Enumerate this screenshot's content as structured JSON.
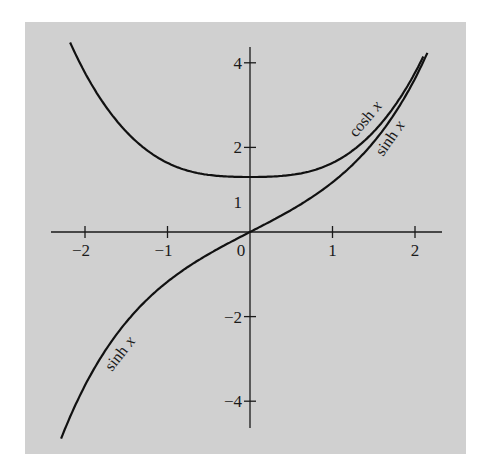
{
  "chart_data": {
    "type": "line",
    "title": "",
    "xlabel": "",
    "ylabel": "",
    "xlim": [
      -2.3,
      2.3
    ],
    "ylim": [
      -4.6,
      4.4
    ],
    "grid": false,
    "legend": "none (inline curve labels)",
    "x_ticks": [
      -2,
      -1,
      0,
      1,
      2
    ],
    "x_tick_labels": [
      "−2",
      "−1",
      "0",
      "1",
      "2"
    ],
    "y_ticks": [
      4,
      2,
      -2,
      -4
    ],
    "y_tick_labels": [
      "4",
      "2",
      "−2",
      "−4"
    ],
    "y_extra_label": {
      "value": 1,
      "text": "1"
    },
    "series": [
      {
        "name": "cosh x",
        "label": "cosh x",
        "x": [
          -2.2,
          -2.0,
          -1.5,
          -1.0,
          -0.5,
          0,
          0.5,
          1.0,
          1.5,
          2.0,
          2.1
        ],
        "y": [
          4.57,
          3.76,
          2.35,
          1.54,
          1.13,
          1.0,
          1.13,
          1.54,
          2.35,
          3.76,
          4.14
        ]
      },
      {
        "name": "sinh x",
        "label": "sinh x",
        "x": [
          -2.2,
          -2.0,
          -1.5,
          -1.0,
          -0.5,
          0,
          0.5,
          1.0,
          1.5,
          2.0,
          2.15
        ],
        "y": [
          -4.46,
          -3.63,
          -2.13,
          -1.18,
          -0.52,
          0,
          0.52,
          1.18,
          2.13,
          3.63,
          4.22
        ]
      }
    ]
  },
  "labels": {
    "cosh": "cosh",
    "sinh": "sinh",
    "x": "x"
  }
}
